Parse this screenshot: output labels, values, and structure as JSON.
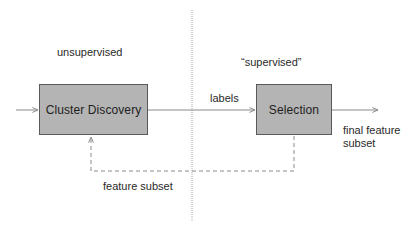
{
  "diagram": {
    "regions": {
      "left_label": "unsupervised",
      "right_label": "“supervised”"
    },
    "nodes": [
      {
        "id": "cluster-discovery",
        "label": "Cluster Discovery"
      },
      {
        "id": "selection",
        "label": "Selection"
      }
    ],
    "edges": {
      "input": {
        "from": "",
        "to": "cluster-discovery",
        "label": ""
      },
      "labels": {
        "from": "cluster-discovery",
        "to": "selection",
        "label": "labels"
      },
      "output": {
        "from": "selection",
        "to": "",
        "label_line1": "final feature",
        "label_line2": "subset"
      },
      "feedback": {
        "from": "selection",
        "to": "cluster-discovery",
        "label": "feature subset",
        "style": "dashed"
      }
    },
    "colors": {
      "box_fill": "#b4b4b4",
      "box_border": "#5a5a5a",
      "line": "#8a8a8a",
      "divider": "#a8a8a8",
      "text": "#2a2a2a"
    }
  }
}
